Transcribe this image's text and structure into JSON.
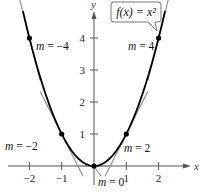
{
  "chart_data": {
    "type": "line",
    "title": "",
    "xlabel": "x",
    "ylabel": "y",
    "xlim": [
      -2.3,
      2.6
    ],
    "ylim": [
      -0.4,
      5.0
    ],
    "x_ticks": [
      -2,
      -1,
      1,
      2
    ],
    "x_tick_labels": [
      "−2",
      "−1",
      "1",
      "2"
    ],
    "y_ticks": [
      1,
      2,
      3,
      4
    ],
    "y_tick_labels": [
      "1",
      "2",
      "3",
      "4"
    ],
    "grid": false,
    "curve": {
      "name": "f(x) = x^2",
      "label": "f(x) = x²",
      "function": "x^2",
      "x_range": [
        -2.2,
        2.2
      ],
      "color": "#000000"
    },
    "tangent_points": [
      {
        "x": -2,
        "y": 4,
        "slope": -4,
        "label": "m = −4"
      },
      {
        "x": -1,
        "y": 1,
        "slope": -2,
        "label": "m = −2"
      },
      {
        "x": 0,
        "y": 0,
        "slope": 0,
        "label": "m = 0"
      },
      {
        "x": 1,
        "y": 1,
        "slope": 2,
        "label": "m = 2"
      },
      {
        "x": 2,
        "y": 4,
        "slope": 4,
        "label": "m = 4"
      }
    ],
    "tangent_color": "#8a8a8a",
    "point_color": "#000000"
  }
}
